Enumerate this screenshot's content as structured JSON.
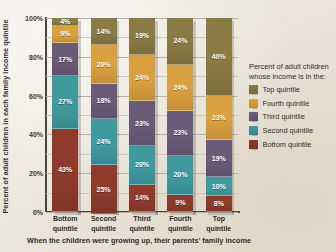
{
  "chart_data": {
    "type": "bar",
    "stacked": true,
    "title": "",
    "xlabel": "When the children were growing up, their parents' family income",
    "ylabel": "Percent of adult children in each family income quintile",
    "categories": [
      "Bottom quintile",
      "Second quintile",
      "Third quintile",
      "Fourth quintile",
      "Top quintile"
    ],
    "category_lines": [
      [
        "Bottom",
        "quintile"
      ],
      [
        "Second",
        "quintile"
      ],
      [
        "Third",
        "quintile"
      ],
      [
        "Fourth",
        "quintile"
      ],
      [
        "Top",
        "quintile"
      ]
    ],
    "ylim": [
      0,
      100
    ],
    "ytick_labels": [
      "0%",
      "20%",
      "40%",
      "60%",
      "80%",
      "100%"
    ],
    "ytick_values": [
      0,
      20,
      40,
      60,
      80,
      100
    ],
    "minor_gridlines": [
      10,
      30,
      50,
      70,
      90
    ],
    "grid": true,
    "legend_position": "right",
    "legend_title": "Percent of adult children whose income is in the:",
    "series": [
      {
        "name": "Top quintile",
        "color": "#8a7a44",
        "values": [
          4,
          14,
          19,
          24,
          40
        ],
        "labels": [
          "4%",
          "14%",
          "19%",
          "24%",
          "40%"
        ]
      },
      {
        "name": "Fourth quintile",
        "color": "#d9a03f",
        "values": [
          9,
          20,
          24,
          24,
          23
        ],
        "labels": [
          "9%",
          "20%",
          "24%",
          "24%",
          "23%"
        ]
      },
      {
        "name": "Third quintile",
        "color": "#6b5a78",
        "values": [
          17,
          18,
          23,
          23,
          19
        ],
        "labels": [
          "17%",
          "18%",
          "23%",
          "23%",
          "19%"
        ]
      },
      {
        "name": "Second quintile",
        "color": "#3f9aa0",
        "values": [
          27,
          24,
          20,
          20,
          10
        ],
        "labels": [
          "27%",
          "24%",
          "20%",
          "20%",
          "10%"
        ]
      },
      {
        "name": "Bottom quintile",
        "color": "#8e3b2c",
        "values": [
          43,
          25,
          14,
          9,
          8
        ],
        "labels": [
          "43%",
          "25%",
          "14%",
          "9%",
          "8%"
        ]
      }
    ]
  },
  "legend": {
    "title": "Percent of adult children whose income is in the:",
    "items": [
      {
        "label": "Top quintile",
        "color": "#8a7a44"
      },
      {
        "label": "Fourth quintile",
        "color": "#d9a03f"
      },
      {
        "label": "Third quintile",
        "color": "#6b5a78"
      },
      {
        "label": "Second quintile",
        "color": "#3f9aa0"
      },
      {
        "label": "Bottom quintile",
        "color": "#8e3b2c"
      }
    ]
  }
}
